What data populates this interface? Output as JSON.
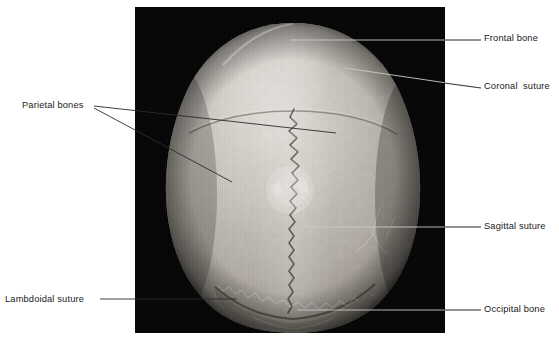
{
  "figure": {
    "background_color": "#ffffff",
    "plate_color": "#050505",
    "line_color": "#2b2b2b"
  },
  "labels": {
    "frontal_bone": "Frontal bone",
    "coronal_suture": "Coronal  suture",
    "parietal_bones": "Parietal bones",
    "sagittal_suture": "Sagittal suture",
    "lambdoidal_suture": "Lambdoidal suture",
    "occipital_bone": "Occipital bone"
  },
  "annotations": [
    {
      "name": "frontal-bone",
      "label": "Frontal bone",
      "side": "right",
      "text_x": 484,
      "text_y": 33,
      "leader": [
        {
          "x": 290,
          "y": 40
        },
        {
          "x": 481,
          "y": 40
        }
      ]
    },
    {
      "name": "coronal-suture",
      "label": "Coronal  suture",
      "side": "right",
      "text_x": 484,
      "text_y": 81,
      "leader": [
        {
          "x": 345,
          "y": 68
        },
        {
          "x": 481,
          "y": 88
        }
      ]
    },
    {
      "name": "parietal-bones-upper",
      "label": "Parietal bones",
      "side": "left",
      "text_x": 22,
      "text_y": 100,
      "leader": [
        {
          "x": 94,
          "y": 106
        },
        {
          "x": 336,
          "y": 133
        }
      ]
    },
    {
      "name": "parietal-bones-lower",
      "label": "Parietal bones",
      "side": "left",
      "text_x": 22,
      "text_y": 100,
      "leader": [
        {
          "x": 94,
          "y": 108
        },
        {
          "x": 232,
          "y": 182
        }
      ]
    },
    {
      "name": "sagittal-suture",
      "label": "Sagittal suture",
      "side": "right",
      "text_x": 484,
      "text_y": 221,
      "leader": [
        {
          "x": 300,
          "y": 227
        },
        {
          "x": 481,
          "y": 227
        }
      ]
    },
    {
      "name": "lambdoidal-suture",
      "label": "Lambdoidal suture",
      "side": "left",
      "text_x": 5,
      "text_y": 294,
      "leader": [
        {
          "x": 100,
          "y": 299
        },
        {
          "x": 237,
          "y": 299
        }
      ]
    },
    {
      "name": "occipital-bone",
      "label": "Occipital bone",
      "side": "right",
      "text_x": 484,
      "text_y": 304,
      "leader": [
        {
          "x": 297,
          "y": 310
        },
        {
          "x": 481,
          "y": 310
        }
      ]
    }
  ],
  "plate": {
    "x": 135,
    "y": 7,
    "width": 310,
    "height": 326
  },
  "specimen": {
    "view": "superior",
    "structures": [
      "Frontal bone",
      "Coronal  suture",
      "Parietal bones",
      "Sagittal suture",
      "Lambdoidal suture",
      "Occipital bone"
    ]
  }
}
